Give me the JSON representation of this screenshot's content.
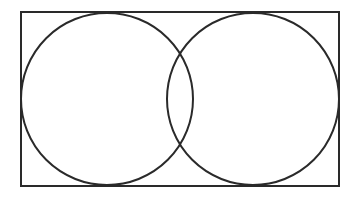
{
  "diagram": {
    "type": "geometric-figure",
    "background": "#ffffff",
    "stroke_color": "#2a2a2a",
    "stroke_width": 2,
    "rectangle": {
      "x": 21,
      "y": 12,
      "width": 318,
      "height": 174
    },
    "circles": [
      {
        "name": "left-circle",
        "cx": 107,
        "cy": 99,
        "r": 86
      },
      {
        "name": "right-circle",
        "cx": 253,
        "cy": 99,
        "r": 86
      }
    ],
    "intersections": [
      {
        "x": 180,
        "y": 53
      },
      {
        "x": 180,
        "y": 145
      }
    ]
  }
}
